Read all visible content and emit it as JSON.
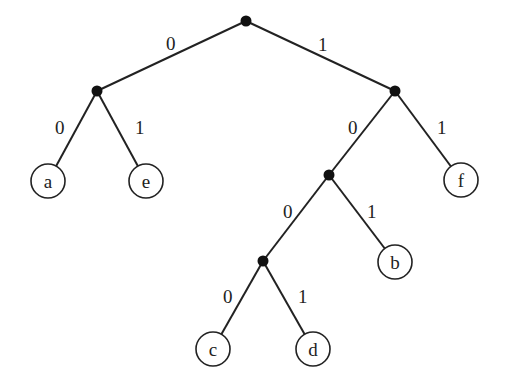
{
  "diagram": {
    "type": "binary-code-tree",
    "internal_nodes": [
      {
        "id": "root",
        "x": 246,
        "y": 21
      },
      {
        "id": "n0",
        "x": 97,
        "y": 91
      },
      {
        "id": "n1",
        "x": 395,
        "y": 91
      },
      {
        "id": "n10",
        "x": 329,
        "y": 175
      },
      {
        "id": "n100",
        "x": 263,
        "y": 261
      }
    ],
    "leaves": [
      {
        "id": "a",
        "label": "a",
        "code": "00",
        "x": 48,
        "y": 181
      },
      {
        "id": "e",
        "label": "e",
        "code": "01",
        "x": 146,
        "y": 181
      },
      {
        "id": "f",
        "label": "f",
        "code": "11",
        "x": 461,
        "y": 180
      },
      {
        "id": "b",
        "label": "b",
        "code": "101",
        "x": 395,
        "y": 262
      },
      {
        "id": "c",
        "label": "c",
        "code": "1000",
        "x": 213,
        "y": 349
      },
      {
        "id": "d",
        "label": "d",
        "code": "1001",
        "x": 313,
        "y": 349
      }
    ],
    "edges": [
      {
        "from": "root",
        "to": "n0",
        "bit": "0",
        "lx": 166,
        "ly": 50
      },
      {
        "from": "root",
        "to": "n1",
        "bit": "1",
        "lx": 318,
        "ly": 51
      },
      {
        "from": "n0",
        "to": "a",
        "bit": "0",
        "lx": 55,
        "ly": 134
      },
      {
        "from": "n0",
        "to": "e",
        "bit": "1",
        "lx": 135,
        "ly": 134
      },
      {
        "from": "n1",
        "to": "n10",
        "bit": "0",
        "lx": 348,
        "ly": 134
      },
      {
        "from": "n1",
        "to": "f",
        "bit": "1",
        "lx": 437,
        "ly": 134
      },
      {
        "from": "n10",
        "to": "b",
        "bit": "1",
        "lx": 367,
        "ly": 218
      },
      {
        "from": "n10",
        "to": "n100",
        "bit": "0",
        "lx": 283,
        "ly": 218
      },
      {
        "from": "n100",
        "to": "c",
        "bit": "0",
        "lx": 223,
        "ly": 303
      },
      {
        "from": "n100",
        "to": "d",
        "bit": "1",
        "lx": 298,
        "ly": 303
      }
    ]
  }
}
